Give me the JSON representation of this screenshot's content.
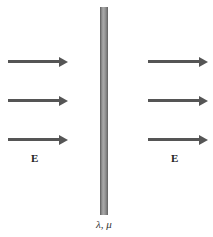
{
  "figure": {
    "field_label_left": "E",
    "field_label_right": "E",
    "rod_label": "λ, μ",
    "left_arrows": [
      {
        "y": 60
      },
      {
        "y": 99
      },
      {
        "y": 138
      }
    ],
    "right_arrows": [
      {
        "y": 60
      },
      {
        "y": 99
      },
      {
        "y": 138
      }
    ],
    "colors": {
      "arrow": "#555555",
      "rod": "#999999"
    }
  }
}
